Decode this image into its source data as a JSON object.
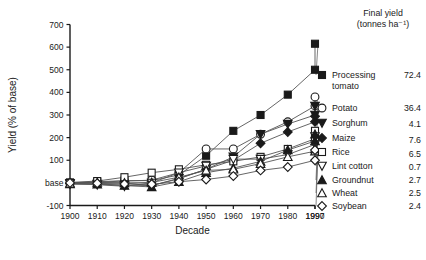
{
  "chart_data": {
    "type": "line",
    "title": "",
    "xlabel": "Decade",
    "ylabel": "Yield (% of base)",
    "xlim": [
      1900,
      1997
    ],
    "ylim": [
      -100,
      700
    ],
    "yticks": [
      700,
      600,
      500,
      400,
      300,
      200,
      100,
      0,
      -100
    ],
    "yticklabels": [
      "700",
      "600",
      "500",
      "400",
      "300",
      "200",
      "100",
      "base",
      "-100"
    ],
    "xticks": [
      1900,
      1910,
      1920,
      1930,
      1940,
      1950,
      1960,
      1970,
      1980,
      1990,
      1997
    ],
    "xticklabels": [
      "1900",
      "1910",
      "1920",
      "1930",
      "1940",
      "1950",
      "1960",
      "1970",
      "1980",
      "1990",
      "1997"
    ],
    "grid": false,
    "legend_position": "right",
    "x": [
      1900,
      1910,
      1920,
      1930,
      1940,
      1950,
      1960,
      1970,
      1980,
      1990,
      1997
    ],
    "series": [
      {
        "name": "Processing tomato",
        "marker": "filled-square",
        "final_yield": "72.4",
        "values": [
          0,
          5,
          10,
          10,
          35,
          120,
          230,
          300,
          390,
          500,
          615
        ]
      },
      {
        "name": "Potato",
        "marker": "open-circle",
        "final_yield": "36.4",
        "values": [
          0,
          3,
          8,
          12,
          45,
          150,
          150,
          215,
          270,
          340,
          380
        ]
      },
      {
        "name": "Sorghum",
        "marker": "filled-down-triangle",
        "final_yield": "4.1",
        "values": [
          -5,
          -5,
          -10,
          -12,
          20,
          60,
          115,
          215,
          260,
          300,
          340
        ]
      },
      {
        "name": "Maize",
        "marker": "filled-diamond",
        "final_yield": "7.6",
        "values": [
          -3,
          0,
          0,
          -12,
          18,
          60,
          100,
          175,
          225,
          270,
          295
        ]
      },
      {
        "name": "Rice",
        "marker": "open-square",
        "final_yield": "6.5",
        "values": [
          2,
          8,
          25,
          45,
          60,
          80,
          95,
          115,
          150,
          195,
          230
        ]
      },
      {
        "name": "Lint cotton",
        "marker": "open-down-triangle",
        "final_yield": "0.7",
        "values": [
          -2,
          -8,
          -15,
          0,
          45,
          75,
          105,
          105,
          125,
          170,
          205
        ]
      },
      {
        "name": "Groundnut",
        "marker": "filled-up-triangle",
        "final_yield": "2.7",
        "values": [
          -5,
          -6,
          -12,
          -18,
          5,
          45,
          65,
          95,
          145,
          185,
          215
        ]
      },
      {
        "name": "Wheat",
        "marker": "open-up-triangle",
        "final_yield": "2.5",
        "values": [
          -2,
          2,
          0,
          2,
          25,
          55,
          60,
          85,
          115,
          140,
          150
        ]
      },
      {
        "name": "Soybean",
        "marker": "open-diamond",
        "final_yield": "2.4",
        "values": [
          0,
          -2,
          -5,
          -6,
          5,
          15,
          30,
          55,
          70,
          100,
          145
        ]
      }
    ]
  },
  "legend": {
    "header_line1": "Final yield",
    "header_line2": "(tonnes ha⁻¹)",
    "entries": [
      {
        "label": "Processing tomato",
        "label_line1": "Processing",
        "label_line2": "tomato",
        "value": "72.4"
      },
      {
        "label": "Potato",
        "value": "36.4"
      },
      {
        "label": "Sorghum",
        "value": "4.1"
      },
      {
        "label": "Maize",
        "value": "7.6"
      },
      {
        "label": "Rice",
        "value": "6.5"
      },
      {
        "label": "Lint cotton",
        "value": "0.7"
      },
      {
        "label": "Groundnut",
        "value": "2.7"
      },
      {
        "label": "Wheat",
        "value": "2.5"
      },
      {
        "label": "Soybean",
        "value": "2.4"
      }
    ]
  },
  "axes": {
    "x_title": "Decade",
    "y_title": "Yield (% of base)"
  },
  "colors": {
    "ink": "#1a1a1a",
    "line": "#555555",
    "background": "#ffffff"
  }
}
